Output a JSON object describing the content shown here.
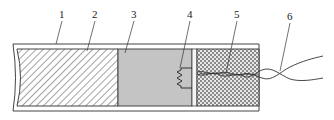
{
  "diagram": {
    "type": "cross-section",
    "labels": [
      {
        "id": "1",
        "text": "1",
        "part": "outer-sheath-tube"
      },
      {
        "id": "2",
        "text": "2",
        "part": "hatched-fill-section"
      },
      {
        "id": "3",
        "text": "3",
        "part": "gray-fill-section"
      },
      {
        "id": "4",
        "text": "4",
        "part": "resistor-element"
      },
      {
        "id": "5",
        "text": "5",
        "part": "checkered-fill-section"
      },
      {
        "id": "6",
        "text": "6",
        "part": "lead-wires"
      }
    ],
    "colors": {
      "outline": "#444444",
      "gray_fill": "#c4c4c4",
      "hatch_line": "#555555",
      "checker_dark": "#8a8a8a",
      "checker_light": "#e8e8e8",
      "wire": "#333333"
    }
  }
}
